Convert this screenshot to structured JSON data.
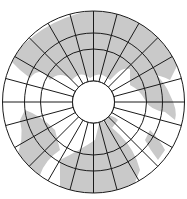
{
  "map": {
    "projection": "polar azimuthal",
    "center": [
      93.5,
      102
    ],
    "rings": [
      91,
      69,
      53,
      21
    ],
    "meridian_count": 24,
    "colors": {
      "land": "#c9c9c9",
      "water": "#ffffff",
      "grid": "#1a1a1a"
    }
  }
}
